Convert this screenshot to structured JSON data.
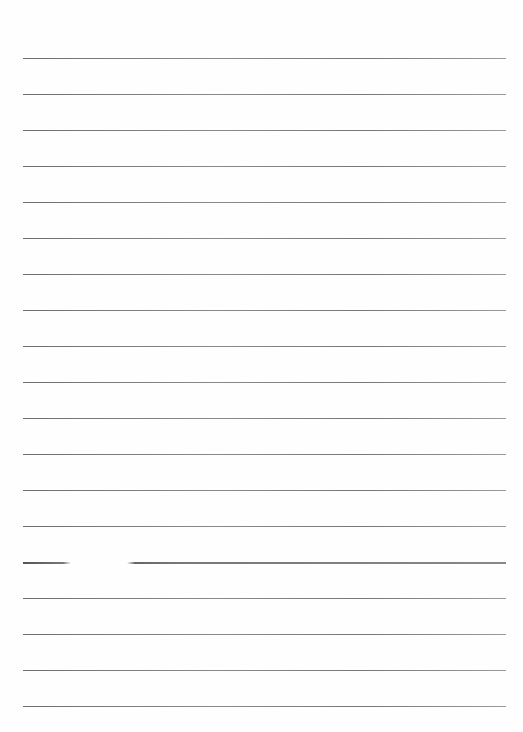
{
  "document": {
    "type": "lined-paper",
    "background_color": "#fefefe",
    "rule_color": "#7a7a7a",
    "rule_count": 19,
    "rule_start_y": 58,
    "rule_spacing": 36,
    "rule_left": 23,
    "rule_right": 506,
    "broken_rule_index": 14,
    "text": []
  }
}
